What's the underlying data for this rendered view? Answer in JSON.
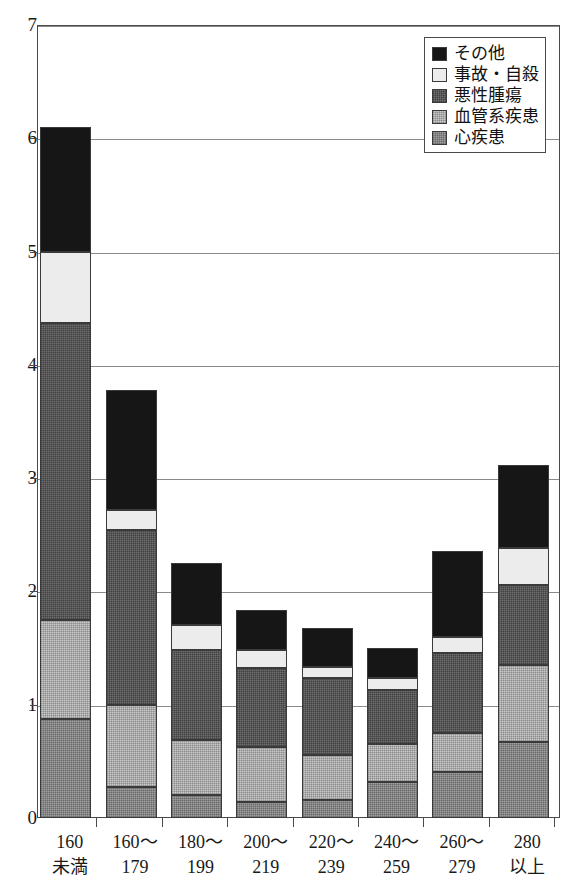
{
  "chart_data": {
    "type": "bar",
    "subtype": "stacked-vertical",
    "title": "",
    "xlabel": "",
    "ylabel": "",
    "ylim": [
      0,
      7
    ],
    "ytick_labels": [
      "0",
      "1",
      "2",
      "3",
      "4",
      "5",
      "6",
      "7"
    ],
    "ytick_values": [
      0,
      1,
      2,
      3,
      4,
      5,
      6,
      7
    ],
    "grid": true,
    "grid_axis": "y",
    "legend_position": "top-right",
    "categories": [
      "160\n未満",
      "160〜\n179",
      "180〜\n199",
      "200〜\n219",
      "220〜\n239",
      "240〜\n259",
      "260〜\n279",
      "280\n以上"
    ],
    "category_lines": [
      [
        "160",
        "未満"
      ],
      [
        "160〜",
        "179"
      ],
      [
        "180〜",
        "199"
      ],
      [
        "200〜",
        "219"
      ],
      [
        "220〜",
        "239"
      ],
      [
        "240〜",
        "259"
      ],
      [
        "260〜",
        "279"
      ],
      [
        "280",
        "以上"
      ]
    ],
    "series": [
      {
        "name": "心疾患",
        "key": "heart",
        "color": "#a0a0a0",
        "values": [
          0.87,
          0.27,
          0.2,
          0.14,
          0.16,
          0.32,
          0.41,
          0.67
        ]
      },
      {
        "name": "血管系疾患",
        "key": "vascular",
        "color": "#c9c9c9",
        "values": [
          0.88,
          0.73,
          0.49,
          0.49,
          0.4,
          0.33,
          0.34,
          0.68
        ]
      },
      {
        "name": "悪性腫瘍",
        "key": "cancer",
        "color": "#6e6e6e",
        "values": [
          2.62,
          1.54,
          0.79,
          0.69,
          0.68,
          0.48,
          0.71,
          0.71
        ]
      },
      {
        "name": "事故・自殺",
        "key": "accident",
        "color": "#ececec",
        "values": [
          0.63,
          0.18,
          0.22,
          0.16,
          0.09,
          0.11,
          0.14,
          0.32
        ]
      },
      {
        "name": "その他",
        "key": "other",
        "color": "#161616",
        "values": [
          1.1,
          1.06,
          0.55,
          0.36,
          0.35,
          0.26,
          0.76,
          0.74
        ]
      }
    ],
    "stack_order_bottom_to_top": [
      "心疾患",
      "血管系疾患",
      "悪性腫瘍",
      "事故・自殺",
      "その他"
    ],
    "totals": [
      6.1,
      3.78,
      2.25,
      1.84,
      1.68,
      1.5,
      2.36,
      3.12
    ]
  },
  "legend": {
    "items": [
      {
        "label": "その他",
        "swatch": "other"
      },
      {
        "label": "事故・自殺",
        "swatch": "accident"
      },
      {
        "label": "悪性腫瘍",
        "swatch": "cancer"
      },
      {
        "label": "血管系疾患",
        "swatch": "vascular"
      },
      {
        "label": "心疾患",
        "swatch": "heart"
      }
    ]
  }
}
